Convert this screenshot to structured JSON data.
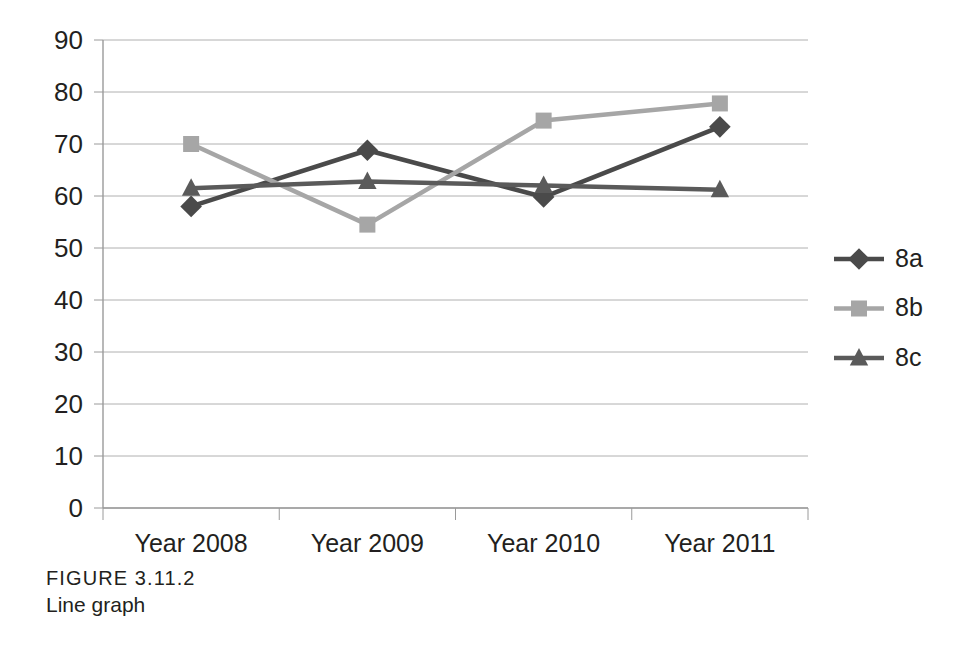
{
  "caption": {
    "figure_number": "FIGURE 3.11.2",
    "figure_title": "Line graph"
  },
  "chart_data": {
    "type": "line",
    "title": "",
    "xlabel": "",
    "ylabel": "",
    "categories": [
      "Year 2008",
      "Year 2009",
      "Year 2010",
      "Year 2011"
    ],
    "ylim": [
      0,
      90
    ],
    "ytick_step": 10,
    "yticks": [
      "90",
      "80",
      "70",
      "60",
      "50",
      "40",
      "30",
      "20",
      "10",
      "0"
    ],
    "grid": true,
    "grid_axis": "y",
    "grid_color": "#b0b0b0",
    "legend_position": "right",
    "series": [
      {
        "name": "8a",
        "marker": "diamond",
        "color": "#4a4a4a",
        "values": [
          58,
          68.8,
          59.8,
          73.3
        ]
      },
      {
        "name": "8b",
        "marker": "square",
        "color": "#a6a6a6",
        "values": [
          70,
          54.5,
          74.5,
          77.8
        ]
      },
      {
        "name": "8c",
        "marker": "triangle",
        "color": "#5a5a5a",
        "values": [
          61.5,
          62.8,
          62,
          61.2
        ]
      }
    ]
  }
}
